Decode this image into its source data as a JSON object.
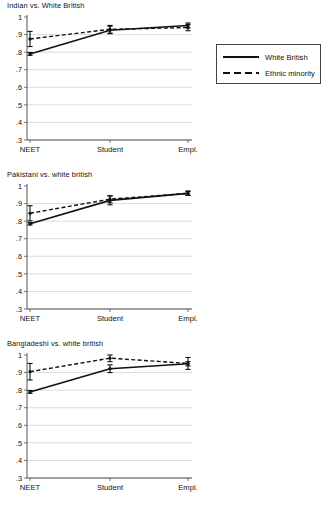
{
  "figure": {
    "background_color": "#ffffff",
    "line_color": "#111111",
    "grid_color": "#cccccc",
    "axis_color": "#555555"
  },
  "legend": {
    "position": "right-of-first-panel",
    "entries": [
      {
        "label": "White British",
        "style": "solid",
        "icon": "solid-line-icon"
      },
      {
        "label": "Ethnic minority",
        "style": "dashed",
        "icon": "dashed-line-icon"
      }
    ]
  },
  "axes": {
    "ytick_labels": [
      "1",
      ".9",
      ".8",
      ".7",
      ".6",
      ".5",
      ".4",
      ".3"
    ],
    "ytick_values": [
      1,
      0.9,
      0.8,
      0.7,
      0.6,
      0.5,
      0.4,
      0.3
    ],
    "xtick_labels": [
      "NEET",
      "Student",
      "Empl."
    ],
    "ylim": [
      0.3,
      1.0
    ],
    "grid": true
  },
  "chart_data": [
    {
      "type": "line",
      "title": "Indian vs. White British",
      "xlabel": "",
      "ylabel": "",
      "categories": [
        "NEET",
        "Student",
        "Empl."
      ],
      "ylim": [
        0.3,
        1.0
      ],
      "grid": true,
      "legend_position": "right",
      "series": [
        {
          "name": "White British",
          "style": "solid",
          "values": [
            0.79,
            0.925,
            0.952
          ],
          "err_low": [
            0.782,
            0.905,
            0.938
          ],
          "err_high": [
            0.798,
            0.948,
            0.966
          ]
        },
        {
          "name": "Ethnic minority",
          "style": "dashed",
          "values": [
            0.875,
            0.93,
            0.94
          ],
          "err_low": [
            0.832,
            0.908,
            0.922
          ],
          "err_high": [
            0.918,
            0.952,
            0.958
          ]
        }
      ]
    },
    {
      "type": "line",
      "title": "Pakistani vs. white british",
      "xlabel": "",
      "ylabel": "",
      "categories": [
        "NEET",
        "Student",
        "Empl."
      ],
      "ylim": [
        0.3,
        1.0
      ],
      "grid": true,
      "legend_position": "none",
      "series": [
        {
          "name": "White British",
          "style": "solid",
          "values": [
            0.785,
            0.918,
            0.958
          ],
          "err_low": [
            0.778,
            0.893,
            0.948
          ],
          "err_high": [
            0.792,
            0.943,
            0.968
          ]
        },
        {
          "name": "Ethnic minority",
          "style": "dashed",
          "values": [
            0.845,
            0.925,
            0.958
          ],
          "err_low": [
            0.802,
            0.905,
            0.946
          ],
          "err_high": [
            0.888,
            0.945,
            0.972
          ]
        }
      ]
    },
    {
      "type": "line",
      "title": "Bangladeshi vs. white british",
      "xlabel": "",
      "ylabel": "",
      "categories": [
        "NEET",
        "Student",
        "Empl."
      ],
      "ylim": [
        0.3,
        1.0
      ],
      "grid": true,
      "legend_position": "none",
      "series": [
        {
          "name": "White British",
          "style": "solid",
          "values": [
            0.79,
            0.922,
            0.95
          ],
          "err_low": [
            0.782,
            0.9,
            0.938
          ],
          "err_high": [
            0.798,
            0.944,
            0.962
          ]
        },
        {
          "name": "Ethnic minority",
          "style": "dashed",
          "values": [
            0.905,
            0.982,
            0.952
          ],
          "err_low": [
            0.858,
            0.962,
            0.918
          ],
          "err_high": [
            0.952,
            1.0,
            0.986
          ]
        }
      ]
    }
  ]
}
